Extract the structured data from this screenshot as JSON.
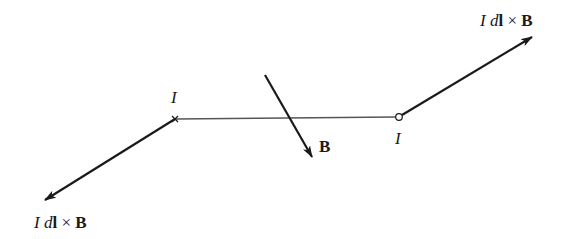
{
  "diagram": {
    "labels": {
      "current_left": "I",
      "current_right": "I",
      "field": "B",
      "force_upper": {
        "I": "I",
        "d": "d",
        "l": "l",
        "times": " × ",
        "B": "B"
      },
      "force_lower": {
        "I": "I",
        "d": "d",
        "l": "l",
        "times": " × ",
        "B": "B"
      }
    },
    "markers": {
      "left": "current-into-page (×)",
      "right": "current-out-of-page (○)"
    },
    "colors": {
      "ink": "#1a1a1a",
      "wire": "#555555",
      "background": "#ffffff"
    }
  }
}
